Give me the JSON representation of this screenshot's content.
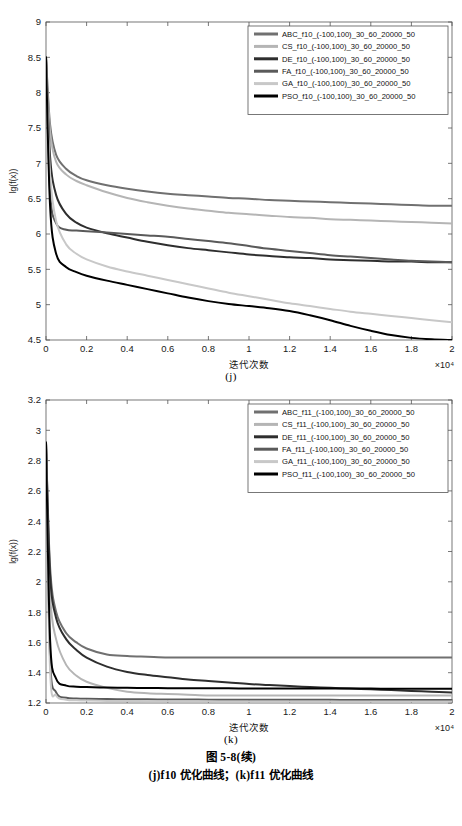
{
  "figure": {
    "caption_main": "图 5-8(续)",
    "caption_sub": "(j)f10 优化曲线；(k)f11 优化曲线",
    "panel_j_label": "(j)",
    "panel_k_label": "(k)"
  },
  "chart_data": [
    {
      "type": "line",
      "panel": "(j)",
      "title": "",
      "xlabel": "迭代次数",
      "ylabel": "lg(f(x))",
      "x_multiplier": "×10⁴",
      "xlim": [
        0,
        2
      ],
      "ylim": [
        4.5,
        9
      ],
      "xticks": [
        "0",
        "0.2",
        "0.4",
        "0.6",
        "0.8",
        "1",
        "1.2",
        "1.4",
        "1.6",
        "1.8",
        "2"
      ],
      "yticks": [
        "4.5",
        "5",
        "5.5",
        "6",
        "6.5",
        "7",
        "7.5",
        "8",
        "8.5",
        "9"
      ],
      "grid": false,
      "legend_position": "top-right",
      "x": [
        0,
        0.02,
        0.05,
        0.1,
        0.15,
        0.2,
        0.3,
        0.4,
        0.5,
        0.6,
        0.7,
        0.8,
        0.9,
        1.0,
        1.1,
        1.2,
        1.3,
        1.4,
        1.5,
        1.6,
        1.7,
        1.8,
        1.9,
        2.0
      ],
      "series": [
        {
          "name": "ABC_f10_(-100,100)_30_60_20000_50",
          "color": "#707070",
          "values": [
            8.5,
            7.55,
            7.12,
            6.92,
            6.82,
            6.76,
            6.69,
            6.64,
            6.6,
            6.57,
            6.55,
            6.53,
            6.51,
            6.5,
            6.48,
            6.47,
            6.46,
            6.45,
            6.44,
            6.43,
            6.42,
            6.41,
            6.4,
            6.4
          ]
        },
        {
          "name": "CS_f10_(-100,100)_30_60_20000_50",
          "color": "#b5b5b5",
          "values": [
            8.5,
            7.45,
            7.02,
            6.84,
            6.75,
            6.69,
            6.59,
            6.51,
            6.45,
            6.4,
            6.36,
            6.33,
            6.3,
            6.28,
            6.26,
            6.24,
            6.23,
            6.21,
            6.2,
            6.19,
            6.18,
            6.17,
            6.16,
            6.15
          ]
        },
        {
          "name": "DE_f10_(-100,100)_30_60_20000_50",
          "color": "#2e2e2e",
          "values": [
            8.5,
            7.1,
            6.55,
            6.28,
            6.16,
            6.09,
            6.01,
            5.95,
            5.89,
            5.84,
            5.8,
            5.77,
            5.74,
            5.71,
            5.69,
            5.67,
            5.66,
            5.64,
            5.63,
            5.62,
            5.61,
            5.61,
            5.6,
            5.6
          ]
        },
        {
          "name": "FA_f10_(-100,100)_30_60_20000_50",
          "color": "#5a5a5a",
          "values": [
            8.5,
            6.6,
            6.15,
            6.06,
            6.05,
            6.04,
            6.02,
            6.0,
            5.98,
            5.96,
            5.93,
            5.9,
            5.87,
            5.83,
            5.79,
            5.76,
            5.73,
            5.7,
            5.68,
            5.66,
            5.64,
            5.62,
            5.61,
            5.6
          ]
        },
        {
          "name": "GA_f10_(-100,100)_30_60_20000_50",
          "color": "#c8c8c8",
          "values": [
            8.5,
            6.85,
            6.18,
            5.85,
            5.72,
            5.64,
            5.54,
            5.47,
            5.41,
            5.35,
            5.29,
            5.23,
            5.17,
            5.12,
            5.07,
            5.02,
            4.98,
            4.94,
            4.9,
            4.87,
            4.84,
            4.81,
            4.78,
            4.75
          ]
        },
        {
          "name": "PSO_f10_(-100,100)_30_60_20000_50",
          "color": "#000000",
          "values": [
            8.5,
            6.4,
            5.72,
            5.53,
            5.46,
            5.41,
            5.34,
            5.28,
            5.22,
            5.16,
            5.1,
            5.05,
            5.01,
            4.98,
            4.95,
            4.91,
            4.85,
            4.78,
            4.7,
            4.63,
            4.57,
            4.53,
            4.51,
            4.5
          ]
        }
      ]
    },
    {
      "type": "line",
      "panel": "(k)",
      "title": "",
      "xlabel": "迭代次数",
      "ylabel": "lg(f(x))",
      "x_multiplier": "×10⁴",
      "xlim": [
        0,
        2
      ],
      "ylim": [
        1.2,
        3.2
      ],
      "xticks": [
        "0",
        "0.2",
        "0.4",
        "0.6",
        "0.8",
        "1",
        "1.2",
        "1.4",
        "1.6",
        "1.8",
        "2"
      ],
      "yticks": [
        "1.2",
        "1.4",
        "1.6",
        "1.8",
        "2",
        "2.2",
        "2.4",
        "2.6",
        "2.8",
        "3",
        "3.2"
      ],
      "grid": false,
      "legend_position": "top-right",
      "x": [
        0,
        0.02,
        0.05,
        0.1,
        0.15,
        0.2,
        0.3,
        0.4,
        0.5,
        0.6,
        0.7,
        0.8,
        0.9,
        1.0,
        1.1,
        1.2,
        1.3,
        1.4,
        1.5,
        1.6,
        1.7,
        1.8,
        1.9,
        2.0
      ],
      "series": [
        {
          "name": "ABC_f11_(-100,100)_30_60_20000_50",
          "color": "#707070",
          "values": [
            2.92,
            2.1,
            1.8,
            1.66,
            1.6,
            1.56,
            1.52,
            1.51,
            1.505,
            1.5,
            1.5,
            1.5,
            1.5,
            1.5,
            1.5,
            1.5,
            1.5,
            1.5,
            1.5,
            1.5,
            1.5,
            1.5,
            1.5,
            1.5
          ]
        },
        {
          "name": "CS_f11_(-100,100)_30_60_20000_50",
          "color": "#b5b5b5",
          "values": [
            2.92,
            1.92,
            1.62,
            1.45,
            1.38,
            1.34,
            1.3,
            1.275,
            1.265,
            1.26,
            1.255,
            1.25,
            1.25,
            1.25,
            1.25,
            1.25,
            1.25,
            1.25,
            1.25,
            1.25,
            1.25,
            1.25,
            1.25,
            1.25
          ]
        },
        {
          "name": "DE_f11_(-100,100)_30_60_20000_50",
          "color": "#2e2e2e",
          "values": [
            2.92,
            2.05,
            1.76,
            1.62,
            1.55,
            1.5,
            1.44,
            1.405,
            1.385,
            1.37,
            1.355,
            1.345,
            1.335,
            1.325,
            1.318,
            1.312,
            1.305,
            1.3,
            1.295,
            1.29,
            1.285,
            1.28,
            1.275,
            1.27
          ]
        },
        {
          "name": "FA_f11_(-100,100)_30_60_20000_50",
          "color": "#5a5a5a",
          "values": [
            2.92,
            1.5,
            1.27,
            1.235,
            1.23,
            1.228,
            1.226,
            1.225,
            1.224,
            1.223,
            1.223,
            1.222,
            1.222,
            1.222,
            1.221,
            1.221,
            1.221,
            1.221,
            1.22,
            1.22,
            1.22,
            1.22,
            1.22,
            1.22
          ]
        },
        {
          "name": "GA_f11_(-100,100)_30_60_20000_50",
          "color": "#c8c8c8",
          "values": [
            2.92,
            1.42,
            1.25,
            1.222,
            1.218,
            1.216,
            1.214,
            1.213,
            1.212,
            1.212,
            1.211,
            1.211,
            1.21,
            1.21,
            1.21,
            1.21,
            1.21,
            1.21,
            1.21,
            1.21,
            1.21,
            1.21,
            1.21,
            1.21
          ]
        },
        {
          "name": "PSO_f11_(-100,100)_30_60_20000_50",
          "color": "#000000",
          "values": [
            2.92,
            1.62,
            1.36,
            1.315,
            1.308,
            1.305,
            1.302,
            1.3,
            1.299,
            1.298,
            1.298,
            1.297,
            1.297,
            1.296,
            1.296,
            1.296,
            1.295,
            1.295,
            1.295,
            1.295,
            1.294,
            1.294,
            1.294,
            1.294
          ]
        }
      ]
    }
  ]
}
